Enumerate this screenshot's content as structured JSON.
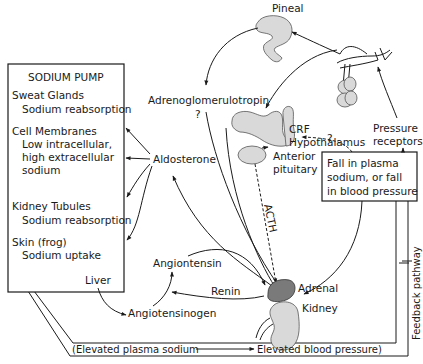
{
  "diagram": {
    "sodium_pump": {
      "title": "SODIUM PUMP",
      "items": [
        {
          "label": "Sweat Glands",
          "sub": [
            "Sodium reabsorption"
          ]
        },
        {
          "label": "Cell Membranes",
          "sub": [
            "Low intracellular,",
            "high extracellular",
            "sodium"
          ]
        },
        {
          "label": "Kidney Tubules",
          "sub": [
            "Sodium reabsorption"
          ]
        },
        {
          "label": "Skin (frog)",
          "sub": [
            "Sodium uptake"
          ]
        }
      ]
    },
    "nodes": {
      "pineal": "Pineal",
      "adrenoglomerulotropin": "Adrenoglomerulotropin",
      "question1": "?",
      "crf": "CRF",
      "hypothalamus": "Hypothalamus",
      "anterior_pituitary_1": "Anterior",
      "anterior_pituitary_2": "pituitary",
      "pressure_receptors_1": "Pressure",
      "pressure_receptors_2": "receptors",
      "question2": "?",
      "aldosterone": "Aldosterone",
      "acth": "ACTH",
      "adrenal": "Adrenal",
      "kidney": "Kidney",
      "angiontensin": "Angiontensin",
      "renin": "Renin",
      "liver": "Liver",
      "angiotensinogen": "Angiotensinogen",
      "feedback_pathway": "Feedback pathway"
    },
    "fall_box": {
      "lines": [
        "Fall in plasma",
        "sodium, or fall",
        "in blood pressure"
      ]
    },
    "bottom_bar": {
      "left": "(Elevated plasma sodium",
      "right": "Elevated blood pressure)"
    }
  }
}
